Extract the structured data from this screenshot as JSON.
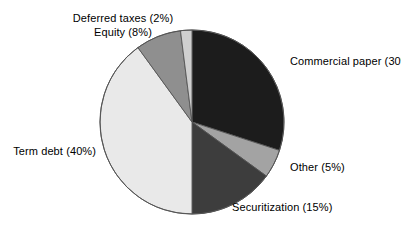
{
  "chart_data": {
    "type": "pie",
    "title": "",
    "subtitle": "",
    "xlabel": "",
    "ylabel": "",
    "legend_position": "none",
    "grid": false,
    "units": "percent",
    "total": 100,
    "start_angle_deg": 0,
    "direction": "clockwise",
    "categories": [
      "Commercial paper",
      "Other",
      "Securitization",
      "Term debt",
      "Equity",
      "Deferred taxes"
    ],
    "values": [
      30,
      5,
      15,
      40,
      8,
      2
    ],
    "slices": [
      {
        "label": "Commercial paper",
        "value": 30,
        "label_text": "Commercial paper (30%)",
        "color": "#1c1c1c",
        "start_deg": 0,
        "end_deg": 108
      },
      {
        "label": "Other",
        "value": 5,
        "label_text": "Other (5%)",
        "color": "#a3a3a3",
        "start_deg": 108,
        "end_deg": 126
      },
      {
        "label": "Securitization",
        "value": 15,
        "label_text": "Securitization (15%)",
        "color": "#3d3d3d",
        "start_deg": 126,
        "end_deg": 180
      },
      {
        "label": "Term debt",
        "value": 40,
        "label_text": "Term debt (40%)",
        "color": "#e9e9e9",
        "start_deg": 180,
        "end_deg": 324
      },
      {
        "label": "Equity",
        "value": 8,
        "label_text": "Equity (8%)",
        "color": "#8f8f8f",
        "start_deg": 324,
        "end_deg": 352.8
      },
      {
        "label": "Deferred taxes",
        "value": 2,
        "label_text": "Deferred taxes (2%)",
        "color": "#cfcfcf",
        "start_deg": 352.8,
        "end_deg": 360
      }
    ],
    "geometry": {
      "center_x": 192,
      "center_y": 122,
      "radius": 92
    },
    "stroke_color": "#555555"
  },
  "labels": {
    "deferred_taxes": "Deferred taxes (2%)",
    "equity": "Equity (8%)",
    "commercial_paper": "Commercial paper (30%)",
    "other": "Other (5%)",
    "securitization": "Securitization (15%)",
    "term_debt": "Term debt (40%)"
  }
}
